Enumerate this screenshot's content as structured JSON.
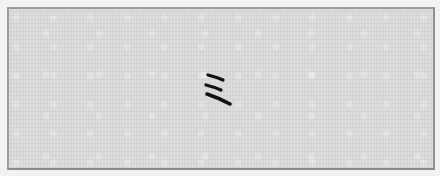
{
  "canvas": {
    "type": "handwritten-glyph-canvas",
    "glyph_char": "ミ",
    "glyph_description": "three slanted handwritten strokes",
    "colors": {
      "page_background": "#f2f2f2",
      "canvas_fill": "#d8d8d8",
      "border": "#9c9c9c",
      "ink": "#111111"
    }
  }
}
